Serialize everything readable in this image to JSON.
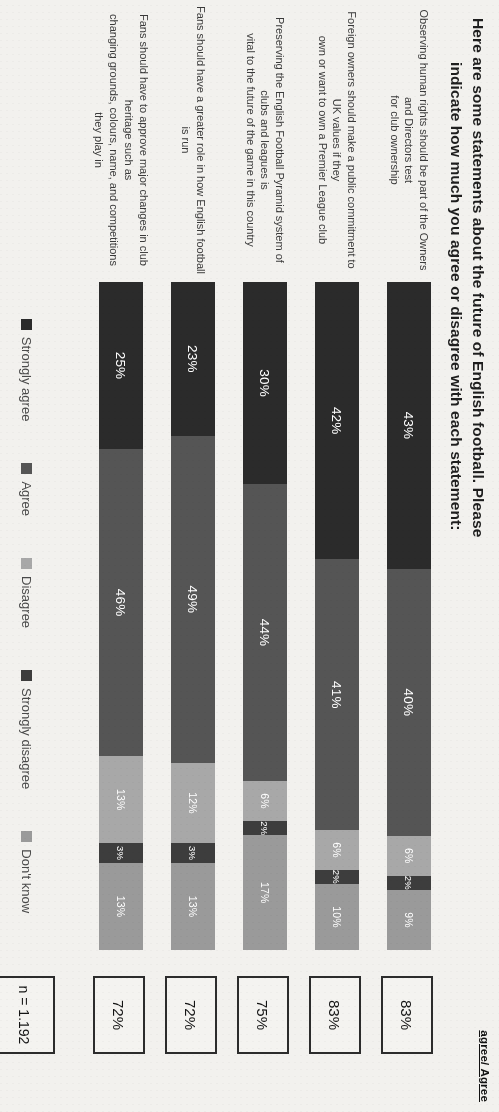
{
  "title": {
    "line1": "Here are some statements about the future of English football. Please",
    "line2": "indicate how much you agree or disagree with each statement:"
  },
  "column_header": "agree/ Agree",
  "sample_note": "n = 1.192",
  "legend": [
    {
      "label": "Strongly agree",
      "color": "#2b2b2b"
    },
    {
      "label": "Agree",
      "color": "#555555"
    },
    {
      "label": "Disagree",
      "color": "#a8a8a8"
    },
    {
      "label": "Strongly disagree",
      "color": "#3d3d3d"
    },
    {
      "label": "Don't know",
      "color": "#9a9a9a"
    }
  ],
  "chart_data": {
    "type": "bar",
    "orientation": "horizontal-stacked",
    "title": "Here are some statements about the future of English football. Please indicate how much you agree or disagree with each statement:",
    "xlabel": "",
    "ylabel": "",
    "xlim": [
      0,
      100
    ],
    "grid": false,
    "legend_position": "bottom",
    "sample_size": "n = 1.192",
    "total_column_label": "agree/ Agree",
    "categories": [
      "Observing human rights should be part of the Owners and Directors test for club ownership",
      "Foreign owners should make a public commitment to UK values if they own or want to own a Premier League club",
      "Preserving the English Football Pyramid system of clubs and leagues is vital to the future of the game in this country",
      "Fans should have a greater role in how English football is run",
      "Fans should have to approve major changes in club heritage such as changing grounds, colours, name, and competitions they play in"
    ],
    "series": [
      {
        "name": "Strongly agree",
        "color": "#2b2b2b",
        "values": [
          43,
          42,
          30,
          23,
          25
        ]
      },
      {
        "name": "Agree",
        "color": "#555555",
        "values": [
          40,
          41,
          44,
          49,
          46
        ]
      },
      {
        "name": "Disagree",
        "color": "#a8a8a8",
        "values": [
          6,
          6,
          6,
          12,
          13
        ]
      },
      {
        "name": "Strongly disagree",
        "color": "#3d3d3d",
        "values": [
          2,
          2,
          2,
          3,
          3
        ]
      },
      {
        "name": "Don't know",
        "color": "#9a9a9a",
        "values": [
          9,
          10,
          17,
          13,
          13
        ]
      }
    ],
    "totals": [
      "83%",
      "83%",
      "75%",
      "72%",
      "72%"
    ]
  },
  "rows": [
    {
      "label_l1": "Observing human rights should be part of the Owners and Directors test",
      "label_l2": "for club ownership",
      "segments": [
        {
          "name": "Strongly agree",
          "label": "43%",
          "value": 43,
          "color": "#2b2b2b"
        },
        {
          "name": "Agree",
          "label": "40%",
          "value": 40,
          "color": "#555555"
        },
        {
          "name": "Disagree",
          "label": "6%",
          "value": 6,
          "color": "#a8a8a8"
        },
        {
          "name": "Strongly disagree",
          "label": "2%",
          "value": 2,
          "color": "#3d3d3d"
        },
        {
          "name": "Don't know",
          "label": "9%",
          "value": 9,
          "color": "#9a9a9a"
        }
      ],
      "total": "83%"
    },
    {
      "label_l1": "Foreign owners should make a public commitment to UK values if they",
      "label_l2": "own or want to own a Premier League club",
      "segments": [
        {
          "name": "Strongly agree",
          "label": "42%",
          "value": 42,
          "color": "#2b2b2b"
        },
        {
          "name": "Agree",
          "label": "41%",
          "value": 41,
          "color": "#555555"
        },
        {
          "name": "Disagree",
          "label": "6%",
          "value": 6,
          "color": "#a8a8a8"
        },
        {
          "name": "Strongly disagree",
          "label": "2%",
          "value": 2,
          "color": "#3d3d3d"
        },
        {
          "name": "Don't know",
          "label": "10%",
          "value": 10,
          "color": "#9a9a9a"
        }
      ],
      "total": "83%"
    },
    {
      "label_l1": "Preserving the English Football Pyramid system of clubs and leagues is",
      "label_l2": "vital to the future of the game in this country",
      "segments": [
        {
          "name": "Strongly agree",
          "label": "30%",
          "value": 30,
          "color": "#2b2b2b"
        },
        {
          "name": "Agree",
          "label": "44%",
          "value": 44,
          "color": "#555555"
        },
        {
          "name": "Disagree",
          "label": "6%",
          "value": 6,
          "color": "#a8a8a8"
        },
        {
          "name": "Strongly disagree",
          "label": "2%",
          "value": 2,
          "color": "#3d3d3d"
        },
        {
          "name": "Don't know",
          "label": "17%",
          "value": 17,
          "color": "#9a9a9a"
        }
      ],
      "total": "75%"
    },
    {
      "label_l1": "Fans should have a greater role in how English football is run",
      "label_l2": "",
      "segments": [
        {
          "name": "Strongly agree",
          "label": "23%",
          "value": 23,
          "color": "#2b2b2b"
        },
        {
          "name": "Agree",
          "label": "49%",
          "value": 49,
          "color": "#555555"
        },
        {
          "name": "Disagree",
          "label": "12%",
          "value": 12,
          "color": "#a8a8a8"
        },
        {
          "name": "Strongly disagree",
          "label": "3%",
          "value": 3,
          "color": "#3d3d3d"
        },
        {
          "name": "Don't know",
          "label": "13%",
          "value": 13,
          "color": "#9a9a9a"
        }
      ],
      "total": "72%"
    },
    {
      "label_l1": "Fans should have to approve major changes in club heritage such as",
      "label_l2": "changing grounds, colours, name, and competitions they play in",
      "segments": [
        {
          "name": "Strongly agree",
          "label": "25%",
          "value": 25,
          "color": "#2b2b2b"
        },
        {
          "name": "Agree",
          "label": "46%",
          "value": 46,
          "color": "#555555"
        },
        {
          "name": "Disagree",
          "label": "13%",
          "value": 13,
          "color": "#a8a8a8"
        },
        {
          "name": "Strongly disagree",
          "label": "3%",
          "value": 3,
          "color": "#3d3d3d"
        },
        {
          "name": "Don't know",
          "label": "13%",
          "value": 13,
          "color": "#9a9a9a"
        }
      ],
      "total": "72%"
    }
  ]
}
